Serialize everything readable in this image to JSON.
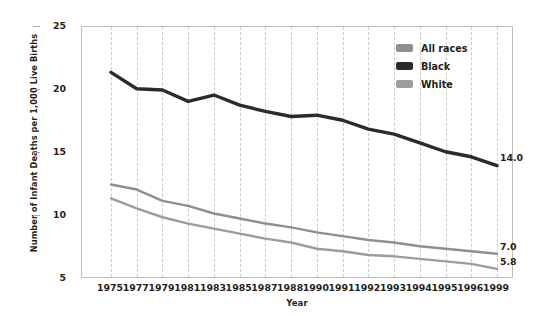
{
  "chart_data": {
    "type": "line",
    "title": "",
    "xlabel": "Year",
    "ylabel": "Number of Infant Deaths per 1,000 Live Births",
    "xlim": [
      1975,
      1999
    ],
    "ylim": [
      5,
      25
    ],
    "yticks": [
      25,
      20,
      15,
      10,
      5
    ],
    "grid": "vertical-dashed",
    "legend_position": "top-right-inside",
    "categories": [
      "1975",
      "1977",
      "1979",
      "1981",
      "1983",
      "1985",
      "1987",
      "1988",
      "1990",
      "1991",
      "1992",
      "1993",
      "1994",
      "1995",
      "1996",
      "1999"
    ],
    "series": [
      {
        "name": "All races",
        "color": "#8d8f91",
        "values": [
          12.5,
          12.1,
          11.2,
          10.8,
          10.2,
          9.8,
          9.4,
          9.1,
          8.7,
          8.4,
          8.1,
          7.9,
          7.6,
          7.4,
          7.2,
          7.0
        ],
        "end_label": "7.0"
      },
      {
        "name": "Black",
        "color": "#2b2b2b",
        "values": [
          21.4,
          20.1,
          20.0,
          19.1,
          19.6,
          18.8,
          18.3,
          17.9,
          18.0,
          17.6,
          16.9,
          16.5,
          15.8,
          15.1,
          14.7,
          14.0
        ],
        "end_label": "14.0"
      },
      {
        "name": "White",
        "color": "#9a9c9e",
        "values": [
          11.4,
          10.6,
          9.9,
          9.4,
          9.0,
          8.6,
          8.2,
          7.9,
          7.4,
          7.2,
          6.9,
          6.8,
          6.6,
          6.4,
          6.2,
          5.8
        ],
        "end_label": "5.8"
      }
    ]
  },
  "axes": {
    "y_title": "Number of Infant Deaths per 1,000 Live Births",
    "x_title": "Year",
    "y_tick_labels": [
      "25",
      "20",
      "15",
      "10",
      "5"
    ],
    "x_tick_labels": [
      "1975",
      "1977",
      "1979",
      "1981",
      "1983",
      "1985",
      "1987",
      "1988",
      "1990",
      "1991",
      "1992",
      "1993",
      "1994",
      "1995",
      "1996",
      "1999"
    ]
  },
  "legend": {
    "items": [
      {
        "label": "All races",
        "color": "#8d8f91"
      },
      {
        "label": "Black",
        "color": "#2b2b2b"
      },
      {
        "label": "White",
        "color": "#9a9c9e"
      }
    ]
  },
  "end_labels": [
    {
      "name": "black-end-label",
      "text": "14.0"
    },
    {
      "name": "all-races-end-label",
      "text": "7.0"
    },
    {
      "name": "white-end-label",
      "text": "5.8"
    }
  ]
}
